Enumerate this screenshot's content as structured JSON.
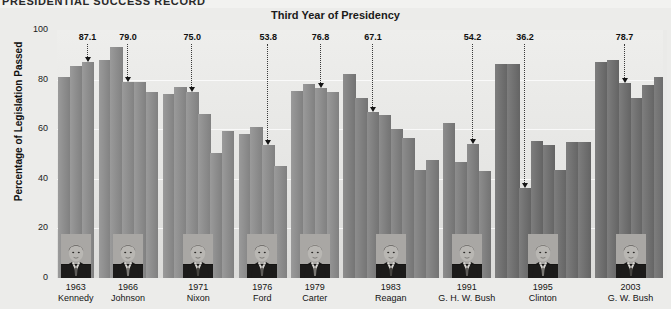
{
  "masthead": {
    "text": "PRESIDENTIAL SUCCESS RECORD"
  },
  "figure": {
    "title": "Third Year of Presidency",
    "y_axis_title": "Percentage of Legislation Passed",
    "y_ticks": [
      "100",
      "80",
      "60",
      "40",
      "20",
      "0"
    ]
  },
  "colors": {
    "background": "#ececea",
    "plot_background": "#e4e4e2",
    "bar": "#8c8c8c",
    "gridline": "#ffffff",
    "text": "#141414",
    "callout": "#101010"
  },
  "chart_data": {
    "type": "bar",
    "title": "Third Year of Presidency",
    "subtitle": "PRESIDENTIAL SUCCESS RECORD",
    "xlabel": "",
    "ylabel": "Percentage of Legislation Passed",
    "ylim": [
      0,
      100
    ],
    "yticks": [
      0,
      20,
      40,
      60,
      80,
      100
    ],
    "grid": true,
    "legend": "none",
    "note": "Each president is one group; each bar is one year in office. The highlighted bar is the president's third year, annotated with its value.",
    "groups": [
      {
        "year_label": "1963",
        "president": "Kennedy",
        "third_year_value": 87.1,
        "third_year_index": 2,
        "years": [
          81.0,
          85.4,
          87.1
        ],
        "values": [
          81.0,
          85.4,
          87.1
        ]
      },
      {
        "year_label": "1966",
        "president": "Johnson",
        "third_year_value": 79.0,
        "third_year_index": 2,
        "years": [
          88.0,
          93.0,
          79.0,
          79.0,
          75.0
        ],
        "values": [
          88.0,
          93.0,
          79.0,
          79.0,
          75.0
        ]
      },
      {
        "year_label": "1971",
        "president": "Nixon",
        "third_year_value": 75.0,
        "third_year_index": 2,
        "years": [
          74.0,
          77.0,
          75.0,
          66.0,
          50.6,
          59.4
        ],
        "values": [
          74.0,
          77.0,
          75.0,
          66.0,
          50.6,
          59.4
        ]
      },
      {
        "year_label": "1976",
        "president": "Ford",
        "third_year_value": 53.8,
        "third_year_index": 2,
        "years": [
          58.2,
          61.0,
          53.8,
          45.0
        ],
        "values": [
          58.2,
          61.0,
          53.8,
          45.0
        ]
      },
      {
        "year_label": "1979",
        "president": "Carter",
        "third_year_value": 76.8,
        "third_year_index": 2,
        "years": [
          75.4,
          78.3,
          76.8,
          75.1
        ],
        "values": [
          75.4,
          78.3,
          76.8,
          75.1
        ]
      },
      {
        "year_label": "1983",
        "president": "Reagan",
        "third_year_value": 67.1,
        "third_year_index": 2,
        "years": [
          82.4,
          72.4,
          67.1,
          65.8,
          59.9,
          56.5,
          43.5,
          47.4
        ],
        "values": [
          82.4,
          72.4,
          67.1,
          65.8,
          59.9,
          56.5,
          43.5,
          47.4
        ]
      },
      {
        "year_label": "1991",
        "president": "G. H. W. Bush",
        "third_year_value": 54.2,
        "third_year_index": 2,
        "years": [
          62.6,
          46.8,
          54.2,
          43.0
        ],
        "values": [
          62.6,
          46.8,
          54.2,
          43.0
        ]
      },
      {
        "year_label": "1995",
        "president": "Clinton",
        "third_year_value": 36.2,
        "third_year_index": 2,
        "years": [
          86.4,
          86.4,
          36.2,
          55.1,
          53.6,
          43.5,
          55.0,
          55.0
        ],
        "values": [
          86.4,
          86.4,
          36.2,
          55.1,
          53.6,
          43.5,
          55.0,
          55.0
        ]
      },
      {
        "year_label": "2003",
        "president": "G. W. Bush",
        "third_year_value": 78.7,
        "third_year_index": 2,
        "years": [
          87.0,
          88.0,
          78.7,
          72.6,
          78.0,
          81.0
        ],
        "values": [
          87.0,
          88.0,
          78.7,
          72.6,
          78.0,
          81.0
        ]
      }
    ],
    "annotations": [
      {
        "label": "87.1",
        "president": "Kennedy"
      },
      {
        "label": "79.0",
        "president": "Johnson"
      },
      {
        "label": "75.0",
        "president": "Nixon"
      },
      {
        "label": "53.8",
        "president": "Ford"
      },
      {
        "label": "76.8",
        "president": "Carter"
      },
      {
        "label": "67.1",
        "president": "Reagan"
      },
      {
        "label": "54.2",
        "president": "G. H. W. Bush"
      },
      {
        "label": "36.2",
        "president": "Clinton"
      },
      {
        "label": "78.7",
        "president": "G. W. Bush"
      }
    ]
  }
}
